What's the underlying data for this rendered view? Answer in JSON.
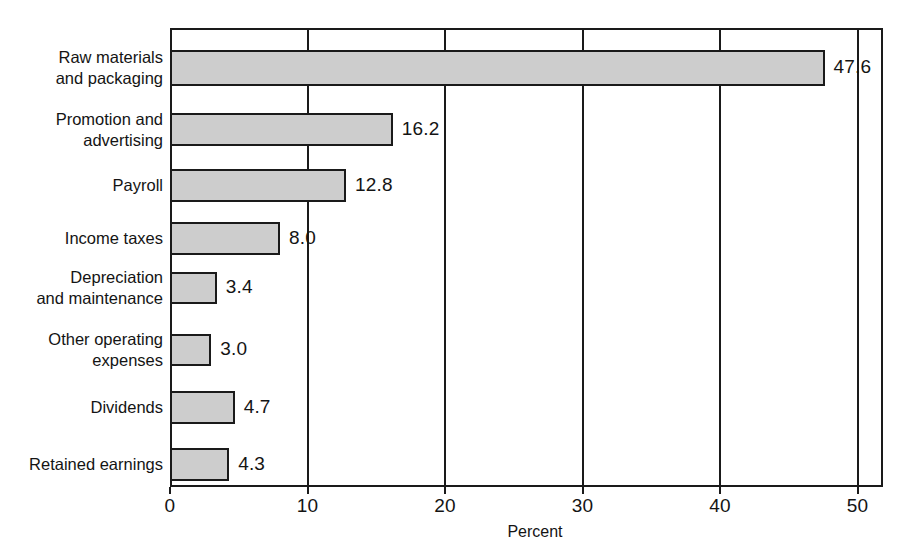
{
  "chart_data": {
    "type": "bar",
    "orientation": "horizontal",
    "title": "",
    "subtitle": "",
    "xlabel": "Percent",
    "ylabel": "",
    "xlim": [
      0,
      52
    ],
    "xticks": [
      0,
      10,
      20,
      30,
      40,
      50
    ],
    "xticklabels": [
      "0",
      "10",
      "20",
      "30",
      "40",
      "50"
    ],
    "grid": "vertical",
    "legend": "none",
    "categories": [
      "Raw materials\nand packaging",
      "Promotion and\nadvertising",
      "Payroll",
      "Income taxes",
      "Depreciation\nand maintenance",
      "Other operating\nexpenses",
      "Dividends",
      "Retained earnings"
    ],
    "values": [
      47.6,
      16.2,
      12.8,
      8.0,
      3.4,
      3.0,
      4.7,
      4.3
    ],
    "value_labels": [
      "47.6",
      "16.2",
      "12.8",
      "8.0",
      "3.4",
      "3.0",
      "4.7",
      "4.3"
    ],
    "bar_fill_color": "#cdcdcd",
    "bar_edge_color": "#1a1a1a",
    "background_color": "#ffffff",
    "bars": [
      {
        "label": "Raw materials\nand packaging",
        "value": 47.6,
        "value_label": "47.6",
        "top": 50,
        "height": 36
      },
      {
        "label": "Promotion and\nadvertising",
        "value": 16.2,
        "value_label": "16.2",
        "top": 113,
        "height": 33
      },
      {
        "label": "Payroll",
        "value": 12.8,
        "value_label": "12.8",
        "top": 169,
        "height": 33
      },
      {
        "label": "Income taxes",
        "value": 8.0,
        "value_label": "8.0",
        "top": 222,
        "height": 33
      },
      {
        "label": "Depreciation\nand maintenance",
        "value": 3.4,
        "value_label": "3.4",
        "top": 272,
        "height": 32
      },
      {
        "label": "Other operating\nexpenses",
        "value": 3.0,
        "value_label": "3.0",
        "top": 334,
        "height": 32
      },
      {
        "label": "Dividends",
        "value": 4.7,
        "value_label": "4.7",
        "top": 391,
        "height": 33
      },
      {
        "label": "Retained earnings",
        "value": 4.3,
        "value_label": "4.3",
        "top": 448,
        "height": 33
      }
    ]
  },
  "axis": {
    "x_title": "Percent",
    "ticks": [
      {
        "value": 0,
        "label": "0"
      },
      {
        "value": 10,
        "label": "10"
      },
      {
        "value": 20,
        "label": "20"
      },
      {
        "value": 30,
        "label": "30"
      },
      {
        "value": 40,
        "label": "40"
      },
      {
        "value": 50,
        "label": "50"
      }
    ]
  }
}
